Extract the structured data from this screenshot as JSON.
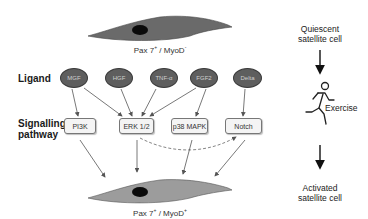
{
  "cells": {
    "quiescent": {
      "marker_main": "Pax 7",
      "marker_sup1": "+",
      "marker_sep": " / MyoD",
      "marker_sup2": "-",
      "fill": "#6a6a6a"
    },
    "activated": {
      "marker_main": "Pax 7",
      "marker_sup1": "+",
      "marker_sep": " / MyoD",
      "marker_sup2": "+",
      "fill": "#9c9c9c"
    }
  },
  "rows": {
    "ligand_label": "Ligand",
    "pathway_label_line1": "Signalling",
    "pathway_label_line2": "pathway"
  },
  "ligands": [
    {
      "label": "MGF"
    },
    {
      "label": "HGF"
    },
    {
      "label": "TNF-α"
    },
    {
      "label": "FGF2"
    },
    {
      "label": "Delta"
    }
  ],
  "pathways": [
    {
      "label": "PI3K"
    },
    {
      "label": "ERK 1/2"
    },
    {
      "label": "p38 MAPK"
    },
    {
      "label": "Notch"
    }
  ],
  "connections": {
    "ligand_to_pathway": [
      [
        "MGF",
        "PI3K"
      ],
      [
        "MGF",
        "ERK 1/2"
      ],
      [
        "HGF",
        "ERK 1/2"
      ],
      [
        "TNF-α",
        "ERK 1/2"
      ],
      [
        "FGF2",
        "ERK 1/2"
      ],
      [
        "FGF2",
        "p38 MAPK"
      ],
      [
        "Delta",
        "Notch"
      ]
    ],
    "pathway_to_pathway_dashed": [
      [
        "ERK 1/2",
        "Notch"
      ]
    ],
    "pathway_to_cell": [
      "PI3K",
      "ERK 1/2",
      "p38 MAPK",
      "Notch"
    ]
  },
  "side": {
    "top_line1": "Quiescent",
    "top_line2": "satellite cell",
    "middle": "Exercise",
    "bottom_line1": "Activated",
    "bottom_line2": "satellite cell",
    "icon": "running-person-icon"
  },
  "colors": {
    "ligand_fill": "#5e5e5e",
    "arrow": "#555555",
    "box_border": "#777777"
  }
}
